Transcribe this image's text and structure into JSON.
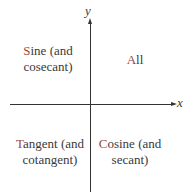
{
  "axes": {
    "x_label": "x",
    "y_label": "y"
  },
  "quadrants": {
    "q1": {
      "initial": "A",
      "rest_line1": "ll",
      "line2": ""
    },
    "q2": {
      "initial": "S",
      "rest_line1": "ine (and",
      "line2": "cosecant)"
    },
    "q3": {
      "initial": "T",
      "rest_line1": "angent (and",
      "line2": "cotangent)"
    },
    "q4": {
      "initial": "C",
      "rest_line1": "osine (and",
      "line2": "secant)"
    }
  },
  "colors": {
    "initial_letter": "#a0463c",
    "text": "#3a3a3a",
    "axis": "#333333"
  }
}
